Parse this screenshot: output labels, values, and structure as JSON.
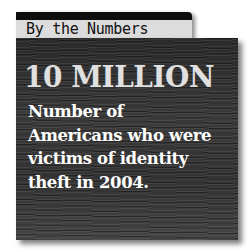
{
  "tab": {
    "label": "By the Numbers"
  },
  "stat": {
    "value": "10 MILLION",
    "description_lines": [
      "Number of",
      "Americans who were",
      "victims of identity",
      "theft in 2004."
    ]
  },
  "colors": {
    "tab_bar": "#0d0d0d",
    "tab_label_bg": "#dcdcdc",
    "panel_bg": "#333333",
    "stat_text": "#e0e0e0",
    "desc_text": "#ffffff"
  }
}
